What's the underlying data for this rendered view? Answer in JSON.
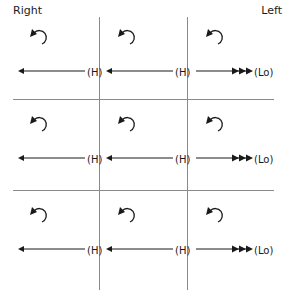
{
  "headers": {
    "left": "Right",
    "right": "Left"
  },
  "grid": {
    "rows": [
      {
        "cells": [
          {
            "arrow": "left",
            "arrowheads": 1,
            "label": "(H)",
            "rotation_icon": "counterclockwise-curl-icon"
          },
          {
            "arrow": "left",
            "arrowheads": 1,
            "label": "(H)",
            "rotation_icon": "counterclockwise-curl-icon"
          },
          {
            "arrow": "right",
            "arrowheads": 3,
            "label": "(Lo)",
            "rotation_icon": "counterclockwise-curl-icon"
          }
        ]
      },
      {
        "cells": [
          {
            "arrow": "left",
            "arrowheads": 1,
            "label": "(H)",
            "rotation_icon": "counterclockwise-curl-icon"
          },
          {
            "arrow": "left",
            "arrowheads": 1,
            "label": "(H)",
            "rotation_icon": "counterclockwise-curl-icon"
          },
          {
            "arrow": "right",
            "arrowheads": 3,
            "label": "(Lo)",
            "rotation_icon": "counterclockwise-curl-icon"
          }
        ]
      },
      {
        "cells": [
          {
            "arrow": "left",
            "arrowheads": 1,
            "label": "(H)",
            "rotation_icon": "counterclockwise-curl-icon"
          },
          {
            "arrow": "left",
            "arrowheads": 1,
            "label": "(H)",
            "rotation_icon": "counterclockwise-curl-icon"
          },
          {
            "arrow": "right",
            "arrowheads": 3,
            "label": "(Lo)",
            "rotation_icon": "counterclockwise-curl-icon"
          }
        ]
      }
    ]
  },
  "colors": {
    "ink": "#1a1a1a",
    "grid_line": "#8a8a8a"
  }
}
